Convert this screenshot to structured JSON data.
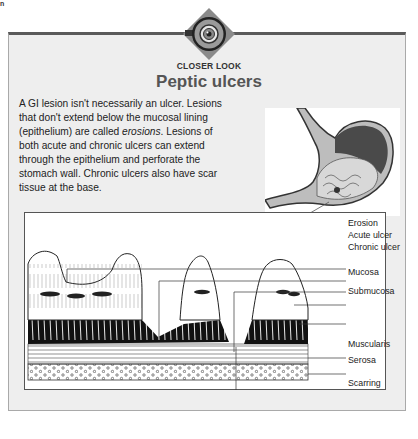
{
  "page_mark": "n",
  "header": {
    "kicker": "CLOSER LOOK",
    "title": "Peptic ulcers",
    "icon": "eye-lens-icon"
  },
  "intro": {
    "line1": "A GI lesion isn't necessarily an ulcer. Lesions that don't extend below the mucosal lining (epithelium) are called ",
    "emphasis": "erosions",
    "line2": ". Lesions of both acute and chronic ulcers can extend through the epithelium and perforate the stomach wall. Chronic ulcers also have scar tissue at the base."
  },
  "illustration": {
    "stomach_alt": "stomach-illustration"
  },
  "diagram": {
    "labels": [
      {
        "text": "Erosion"
      },
      {
        "text": "Acute ulcer"
      },
      {
        "text": "Chronic ulcer"
      },
      {
        "text": "Mucosa"
      },
      {
        "text": "Submucosa"
      },
      {
        "text": "Muscularis"
      },
      {
        "text": "Serosa"
      },
      {
        "text": "Scarring"
      }
    ]
  },
  "colors": {
    "panel_bg": "#eeeeee",
    "panel_top_border": "#5a5a5a",
    "title": "#555555",
    "text": "#222222"
  }
}
